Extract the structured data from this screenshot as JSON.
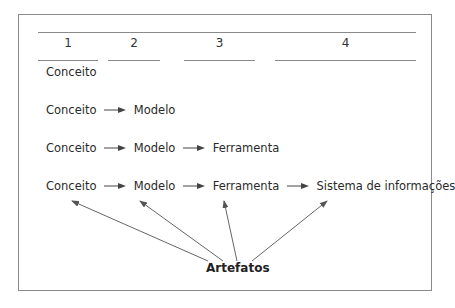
{
  "columns": [
    "1",
    "2",
    "3",
    "4"
  ],
  "rows": [
    [
      "Conceito"
    ],
    [
      "Conceito",
      "Modelo"
    ],
    [
      "Conceito",
      "Modelo",
      "Ferramenta"
    ],
    [
      "Conceito",
      "Modelo",
      "Ferramenta",
      "Sistema de informações"
    ]
  ],
  "label": "Artefatos",
  "colors": {
    "line": "#8a8a8a",
    "text": "#2a2a2a",
    "arrow": "#555555"
  }
}
